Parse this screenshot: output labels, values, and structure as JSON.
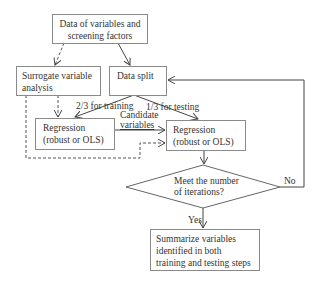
{
  "nodes": {
    "data": {
      "line1": "Data of variables and",
      "line2": "screening factors"
    },
    "surrogate": {
      "line1": "Surrogate variable",
      "line2": "analysis"
    },
    "split": {
      "line1": "Data split"
    },
    "reg_train": {
      "line1": "Regression",
      "line2": "(robust or OLS)"
    },
    "reg_test": {
      "line1": "Regression",
      "line2": "(robust or OLS)"
    },
    "decision": {
      "line1": "Meet the number",
      "line2": "of iterations?"
    },
    "summary": {
      "line1": "Summarize variables",
      "line2": "identified in both",
      "line3": "training and testing steps"
    }
  },
  "edges": {
    "train": "2/3 for training",
    "test": "1/3 for testing",
    "candidate1": "Candidate",
    "candidate2": "variables",
    "yes": "Yes",
    "no": "No"
  }
}
